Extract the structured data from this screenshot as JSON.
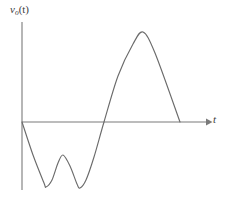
{
  "figure": {
    "background_color": "#ffffff",
    "line_color": "#6b6b6b",
    "axis_color": "#7a7a7a",
    "text_color": "#3d3d3d",
    "width": 229,
    "height": 197
  },
  "labels": {
    "y_axis_base": "v",
    "y_axis_subscript": "o",
    "y_axis_arg": "(t)",
    "y_axis_full": "v_o(t)",
    "t_axis": "t"
  },
  "chart_data": {
    "type": "line",
    "title": "",
    "subtitle": "",
    "xlabel": "t",
    "ylabel": "v_o(t)",
    "legend": [],
    "grid": false,
    "xlim": [
      0,
      10
    ],
    "ylim": [
      -4.5,
      6
    ],
    "xticks": [],
    "yticks": [],
    "annotations": [],
    "axes": {
      "x_axis_visible": true,
      "y_axis_visible": true,
      "x_axis_arrow": true,
      "y_axis_arrow": false,
      "origin_px": [
        22,
        122
      ],
      "x_axis_end_px": [
        208,
        122
      ],
      "y_axis_top_px": [
        22,
        22
      ],
      "y_axis_bottom_px": [
        22,
        190
      ]
    },
    "series": [
      {
        "name": "v_o(t)",
        "color": "#6b6b6b",
        "x": [
          0.0,
          0.6,
          1.2,
          1.52,
          1.85,
          2.2,
          2.6,
          3.0,
          3.4,
          3.7,
          4.0,
          4.4,
          5.2,
          6.0,
          6.8,
          7.4,
          8.0,
          8.6
        ],
        "y": [
          0.0,
          -1.8,
          -3.7,
          -4.0,
          -3.1,
          -1.9,
          -1.55,
          -2.2,
          -3.7,
          -4.05,
          -3.5,
          -1.9,
          0.0,
          2.8,
          4.8,
          5.15,
          4.1,
          0.0
        ],
        "points_px": [
          [
            22,
            122
          ],
          [
            33,
            155
          ],
          [
            44,
            183
          ],
          [
            46,
            187
          ],
          [
            52,
            180
          ],
          [
            58,
            163
          ],
          [
            63,
            155
          ],
          [
            70,
            166
          ],
          [
            77,
            184
          ],
          [
            80,
            188
          ],
          [
            86,
            180
          ],
          [
            94,
            157
          ],
          [
            104,
            122
          ],
          [
            118,
            76
          ],
          [
            133,
            44
          ],
          [
            143,
            32
          ],
          [
            155,
            53
          ],
          [
            180,
            122
          ]
        ]
      }
    ],
    "key_features": {
      "start": {
        "x_px": 22,
        "y_px": 122,
        "description": "curve begins at origin"
      },
      "valley_1": {
        "x_px": 46,
        "y_px": 187,
        "value": -4.0
      },
      "local_peak": {
        "x_px": 63,
        "y_px": 155,
        "value": -1.55
      },
      "valley_2": {
        "x_px": 80,
        "y_px": 188,
        "value": -4.05
      },
      "zero_crossing": {
        "x_px": 104,
        "y_px": 122,
        "value": 0.0
      },
      "global_peak": {
        "x_px": 143,
        "y_px": 32,
        "value": 5.15
      },
      "end": {
        "x_px": 180,
        "y_px": 122,
        "value": 0.0
      }
    }
  }
}
